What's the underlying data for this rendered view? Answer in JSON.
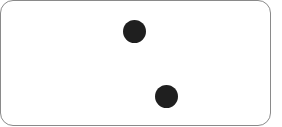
{
  "tile": {
    "type": "domino-half",
    "pip_count": 2,
    "pip_color": "#1f1f1f",
    "border_color": "#8a8a8a",
    "pips": [
      {
        "cx": 134,
        "cy": 31
      },
      {
        "cx": 166,
        "cy": 96
      }
    ]
  }
}
